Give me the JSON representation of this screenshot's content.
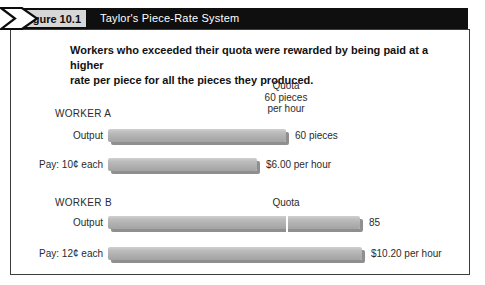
{
  "header": {
    "figure_label": "Figure 10.1",
    "title": "Taylor's Piece-Rate System"
  },
  "caption": {
    "lines": [
      "Workers who exceeded their quota were rewarded by being paid at a higher",
      "rate per piece for all the pieces they produced."
    ]
  },
  "chart_data": {
    "type": "bar",
    "orientation": "horizontal",
    "title": "Taylor's Piece-Rate System",
    "caption": "Workers who exceeded their quota were rewarded by being paid at a higher rate per piece for all the pieces they produced.",
    "quota": {
      "value": 60,
      "annotation_lines": [
        "Quota",
        "60 pieces",
        "per hour"
      ],
      "marker_label": "Quota"
    },
    "groups": [
      {
        "name": "WORKER A",
        "bars": [
          {
            "label": "Output",
            "value": 60,
            "unit": "pieces",
            "value_label": "60 pieces"
          },
          {
            "label": "Pay: 10¢ each",
            "value": 6.0,
            "unit": "dollars",
            "value_label": "$6.00 per hour"
          }
        ]
      },
      {
        "name": "WORKER B",
        "bars": [
          {
            "label": "Output",
            "value": 85,
            "unit": "pieces",
            "value_label": "85",
            "quota_marker": true
          },
          {
            "label": "Pay: 12¢ each",
            "value": 10.2,
            "unit": "dollars",
            "value_label": "$10.20 per hour"
          }
        ]
      }
    ],
    "layout": {
      "px_per_piece": 2.97,
      "px_per_dollar": 24.9,
      "legend": "none",
      "grid": false
    }
  },
  "colors": {
    "header_bar": "#0f0f0f",
    "figure_box_bg": "#d7d7d7",
    "content_border": "#3c3c3c",
    "bar_fill": "#b0b0b0",
    "bar_shadow": "#8f8f8f",
    "quota_tick": "#ffffff",
    "text": "#2b2b2b"
  }
}
